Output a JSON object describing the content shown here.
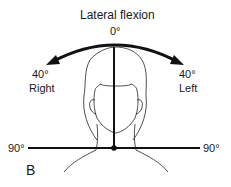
{
  "diagram": {
    "title": "Lateral flexion",
    "top_angle": "0°",
    "right": {
      "angle": "40°",
      "label": "Right"
    },
    "left": {
      "angle": "40°",
      "label": "Left"
    },
    "horizontal_left": "90°",
    "horizontal_right": "90°",
    "panel_label": "B"
  }
}
